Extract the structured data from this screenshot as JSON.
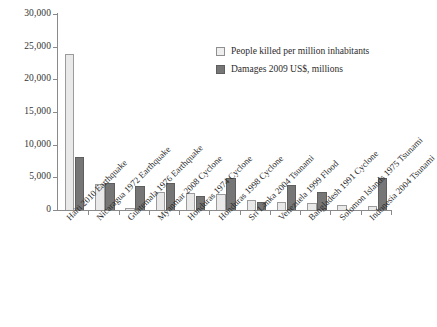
{
  "chart_data": {
    "type": "bar",
    "title": "",
    "xlabel": "",
    "ylabel": "",
    "ylim": [
      0,
      30000
    ],
    "ytick_labels": [
      "30,000",
      "25,000",
      "20,000",
      "15,000",
      "10,000",
      "5,000",
      "0"
    ],
    "ytick_values": [
      30000,
      25000,
      20000,
      15000,
      10000,
      5000,
      0
    ],
    "grid": false,
    "legend_position": "upper right inside",
    "categories": [
      "Haiti 2010 Earthquake",
      "Nicaragua 1972 Earthquake",
      "Guatemala 1976 Earthquake",
      "Myanmar 2008 Cyclone",
      "Honduras 1974 Cyclone",
      "Honduras 1998 Cyclone",
      "Sri Lanka 2004 Tsunami",
      "Venezuela 1999 Flood",
      "Bangladesh 1991 Cyclone",
      "Solomon Islands 1975 Tsunami",
      "Indonesia 2004 Tsunami"
    ],
    "series": [
      {
        "name": "People killed per million inhabitants",
        "color": "#e9e9e9",
        "values": [
          23900,
          4000,
          300,
          2800,
          2600,
          2400,
          1600,
          1200,
          1100,
          800,
          600
        ]
      },
      {
        "name": "Damages 2009 US$, millions",
        "color": "#767676",
        "values": [
          8100,
          4200,
          3700,
          4100,
          2200,
          4900,
          1300,
          3900,
          2800,
          0,
          4900
        ]
      }
    ]
  },
  "legend": {
    "items": [
      {
        "label": "People killed per million inhabitants",
        "swatch": "killed"
      },
      {
        "label": "Damages 2009 US$, millions",
        "swatch": "damages"
      }
    ]
  }
}
